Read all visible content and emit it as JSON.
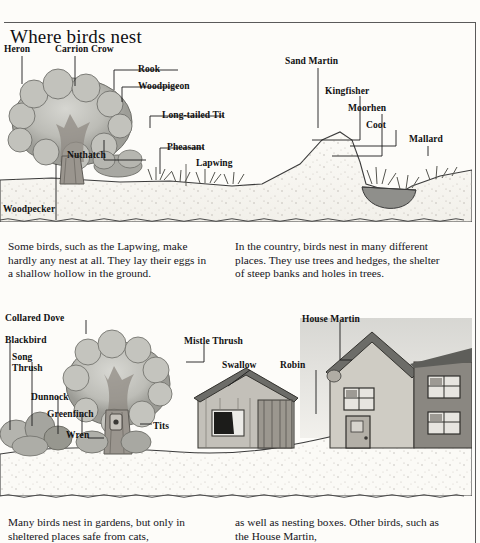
{
  "page": {
    "title": "Where birds nest"
  },
  "scene_top": {
    "name": "countryside-scene",
    "labels": [
      {
        "id": "heron",
        "text": "Heron",
        "x": 4,
        "y": 44
      },
      {
        "id": "carrion-crow",
        "text": "Carrion Crow",
        "x": 55,
        "y": 44
      },
      {
        "id": "rook",
        "text": "Rook",
        "x": 138,
        "y": 64
      },
      {
        "id": "woodpigeon",
        "text": "Woodpigeon",
        "x": 138,
        "y": 81
      },
      {
        "id": "long-tailed-tit",
        "text": "Long-tailed Tit",
        "x": 162,
        "y": 110
      },
      {
        "id": "pheasant",
        "text": "Pheasant",
        "x": 167,
        "y": 142
      },
      {
        "id": "lapwing",
        "text": "Lapwing",
        "x": 196,
        "y": 158
      },
      {
        "id": "nuthatch",
        "text": "Nuthatch",
        "x": 67,
        "y": 150
      },
      {
        "id": "woodpecker",
        "text": "Woodpecker",
        "x": 3,
        "y": 204
      },
      {
        "id": "sand-martin",
        "text": "Sand Martin",
        "x": 285,
        "y": 56
      },
      {
        "id": "kingfisher",
        "text": "Kingfisher",
        "x": 325,
        "y": 86
      },
      {
        "id": "moorhen",
        "text": "Moorhen",
        "x": 348,
        "y": 103
      },
      {
        "id": "coot",
        "text": "Coot",
        "x": 366,
        "y": 120
      },
      {
        "id": "mallard",
        "text": "Mallard",
        "x": 409,
        "y": 134
      }
    ]
  },
  "scene_bottom": {
    "name": "garden-scene",
    "labels": [
      {
        "id": "collared-dove",
        "text": "Collared Dove",
        "x": 5,
        "y": 313
      },
      {
        "id": "blackbird",
        "text": "Blackbird",
        "x": 5,
        "y": 335
      },
      {
        "id": "song-thrush",
        "text": "Song\nThrush",
        "x": 12,
        "y": 352
      },
      {
        "id": "dunnock",
        "text": "Dunnock",
        "x": 31,
        "y": 392
      },
      {
        "id": "greenfinch",
        "text": "Greenfinch",
        "x": 47,
        "y": 409
      },
      {
        "id": "wren",
        "text": "Wren",
        "x": 66,
        "y": 430
      },
      {
        "id": "tits",
        "text": "Tits",
        "x": 153,
        "y": 421
      },
      {
        "id": "mistle-thrush",
        "text": "Mistle Thrush",
        "x": 184,
        "y": 336
      },
      {
        "id": "swallow",
        "text": "Swallow",
        "x": 222,
        "y": 360
      },
      {
        "id": "robin",
        "text": "Robin",
        "x": 280,
        "y": 360
      },
      {
        "id": "house-martin",
        "text": "House Martin",
        "x": 302,
        "y": 314
      }
    ]
  },
  "text": {
    "left_1": "Some birds, such as the Lapwing, make hardly any nest at all. They lay their eggs in a shallow hollow in the ground.",
    "right_1": "In the country, birds nest in many different places. They use trees and hedges, the shelter of steep banks and holes in trees.",
    "left_2": "Many birds nest in gardens, but only in sheltered places safe from cats,",
    "right_2": "as well as nesting boxes. Other birds, such as the House Martin,"
  },
  "colors": {
    "paper": "#fdfcf9",
    "ink": "#111111",
    "rule": "#5a5a5a",
    "foliage_light": "#c9c9c4",
    "foliage_mid": "#a9a9a3",
    "foliage_dark": "#7e7e79",
    "trunk": "#9a958e",
    "ground": "#fbfaf6",
    "ground_speck": "#a9a49c",
    "water": "#8f8f8b",
    "roof_dark": "#6c6c68",
    "wall_light": "#cfccc4",
    "wall_dark": "#8a8781",
    "sky_wash": "#bdbdb8"
  }
}
